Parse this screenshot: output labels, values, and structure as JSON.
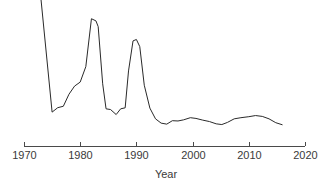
{
  "chart_data": {
    "type": "line",
    "title": "",
    "xlabel": "Year",
    "ylabel": "",
    "xlim": [
      1970,
      2020
    ],
    "ylim": [
      0,
      1
    ],
    "grid": false,
    "legend": null,
    "xticks": [
      1970,
      1980,
      1990,
      2000,
      2010,
      2020
    ],
    "xtick_labels": [
      "1970",
      "1980",
      "1990",
      "2000",
      "2010",
      "2020"
    ],
    "yticks": [],
    "ytick_labels": [],
    "series": [
      {
        "name": "series-1",
        "color": "#2a2a2a",
        "x": [
          1973.0,
          1975.0,
          1976.0,
          1977.0,
          1978.0,
          1979.0,
          1980.0,
          1981.0,
          1982.0,
          1982.8,
          1983.2,
          1984.0,
          1984.6,
          1985.4,
          1986.4,
          1987.2,
          1988.0,
          1988.6,
          1989.4,
          1990.0,
          1990.6,
          1991.4,
          1992.4,
          1993.4,
          1994.4,
          1995.4,
          1996.4,
          1997.4,
          1998.4,
          1999.6,
          2000.6,
          2001.8,
          2003.0,
          2004.2,
          2005.2,
          2006.2,
          2007.4,
          2008.6,
          2010.0,
          2011.2,
          2012.4,
          2013.6,
          2014.8,
          2016.0
        ],
        "y": [
          1.0,
          0.202,
          0.233,
          0.243,
          0.327,
          0.384,
          0.412,
          0.52,
          0.855,
          0.84,
          0.8,
          0.4,
          0.225,
          0.22,
          0.185,
          0.225,
          0.232,
          0.49,
          0.7,
          0.71,
          0.66,
          0.39,
          0.23,
          0.155,
          0.125,
          0.118,
          0.142,
          0.14,
          0.148,
          0.163,
          0.158,
          0.146,
          0.136,
          0.12,
          0.115,
          0.13,
          0.155,
          0.163,
          0.17,
          0.178,
          0.172,
          0.155,
          0.128,
          0.113
        ]
      }
    ]
  },
  "axis": {
    "x_title": "Year"
  }
}
